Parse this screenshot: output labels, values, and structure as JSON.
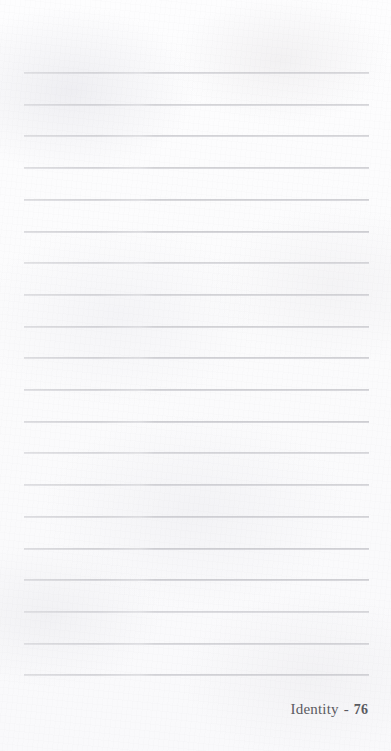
{
  "page": {
    "width": 391,
    "height": 751,
    "background_color": "#fcfcfd",
    "kind": "lined-notebook-page"
  },
  "ruled_lines": {
    "color": "#b2b2b8",
    "count": 20,
    "left_x": 24,
    "right_x": 369,
    "first_y": 73,
    "spacing": 31.7,
    "y_positions": [
      73,
      105,
      137,
      168,
      175,
      208,
      241,
      275,
      310,
      342,
      375,
      408,
      444,
      478,
      510,
      547,
      579,
      611,
      643,
      676
    ]
  },
  "footer": {
    "label": "Identity",
    "separator": "-",
    "page_number": "76",
    "color": "#5a5a60",
    "align": "right",
    "right_x": 368,
    "baseline_y": 714
  }
}
